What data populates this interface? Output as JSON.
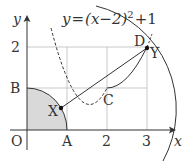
{
  "figure": {
    "equation": {
      "lhs": "y",
      "eq": "=",
      "body": "(x−2)",
      "exp": "2",
      "tail": "+1"
    },
    "axes": {
      "x_label": "x",
      "y_label": "y"
    },
    "ticks": {
      "origin": "O",
      "x_A": "A",
      "x_2": "2",
      "x_3": "3",
      "y_B": "B",
      "y_2": "2"
    },
    "points": {
      "C": "C",
      "D": "D",
      "X": "X",
      "Y": "Y"
    },
    "colors": {
      "ink": "#333333",
      "grid": "#bbbbbb",
      "shade": "#d9d9d9"
    }
  }
}
